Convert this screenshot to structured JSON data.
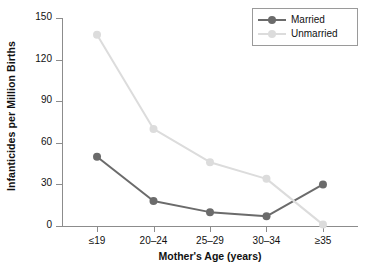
{
  "chart_data": {
    "type": "line",
    "title": "",
    "xlabel": "Mother's Age (years)",
    "ylabel": "Infanticides per Million Births",
    "categories": [
      "≤19",
      "20–24",
      "25–29",
      "30–34",
      "≥35"
    ],
    "series": [
      {
        "name": "Married",
        "color": "#6b6b6b",
        "values": [
          50,
          18,
          10,
          7,
          30
        ]
      },
      {
        "name": "Unmarried",
        "color": "#dcdcdc",
        "values": [
          138,
          70,
          46,
          34,
          1
        ]
      }
    ],
    "ylim": [
      0,
      150
    ],
    "yticks": [
      0,
      30,
      60,
      90,
      120,
      150
    ],
    "ytick_labels": [
      "0",
      "30",
      "60",
      "90",
      "120",
      "150"
    ],
    "grid": false,
    "legend_position": "top-right",
    "legend_entries": [
      "Married",
      "Unmarried"
    ]
  },
  "axes": {
    "y_title": "Infanticides per Million Births",
    "x_title": "Mother's Age (years)"
  },
  "legend": {
    "items": [
      {
        "label": "Married"
      },
      {
        "label": "Unmarried"
      }
    ]
  }
}
